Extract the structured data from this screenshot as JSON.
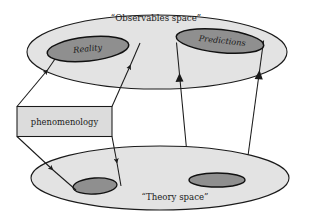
{
  "figure": {
    "background_color": "#ffffff",
    "line_color": "#1a1a1a",
    "plane_fill_color": "#e0e0e0",
    "region_fill_color": "#9a9a9a",
    "box_fill_color": "#dcdcdc"
  },
  "labels": {
    "observables_space": "“Observables space”",
    "theory_space": "“Theory space”",
    "reality": "Reality",
    "predictions": "Predictions",
    "phenomenology": "phenomenology"
  },
  "elements": {
    "observables_plane": {
      "name": "Observables space",
      "shape": "ellipse",
      "cx": 157,
      "cy": 52,
      "rx": 130,
      "ry": 37
    },
    "theory_plane": {
      "name": "Theory space",
      "shape": "ellipse",
      "cx": 160,
      "cy": 178,
      "rx": 129,
      "ry": 32
    },
    "reality_region": {
      "name": "Reality",
      "shape": "ellipse",
      "cx": 88,
      "cy": 49,
      "rx": 41,
      "ry": 12,
      "rotation": -6
    },
    "predictions_region": {
      "name": "Predictions",
      "shape": "ellipse",
      "cx": 220,
      "cy": 41,
      "rx": 44,
      "ry": 12,
      "rotation": 6
    },
    "theory_region": {
      "name": "theory region",
      "shape": "ellipse",
      "cx": 95,
      "cy": 186,
      "rx": 22,
      "ry": 8,
      "rotation": -4
    },
    "predictions_base_region": {
      "name": "predictions base region",
      "shape": "ellipse",
      "cx": 217,
      "cy": 180,
      "rx": 28,
      "ry": 7
    },
    "phenomenology_box": {
      "name": "phenomenology",
      "shape": "rectangle",
      "x": 17,
      "y": 106,
      "width": 95,
      "height": 31
    }
  },
  "connections": [
    {
      "name": "phenomenology-to-reality-left",
      "from": "phenomenology_box",
      "to": "reality_region",
      "direction": "up",
      "arrowhead": true
    },
    {
      "name": "phenomenology-to-reality-right",
      "from": "phenomenology_box",
      "to": "reality_region",
      "direction": "up",
      "arrowhead": true
    },
    {
      "name": "phenomenology-to-theory-left",
      "from": "phenomenology_box",
      "to": "theory_region",
      "direction": "down",
      "arrowhead": true
    },
    {
      "name": "phenomenology-to-theory-right",
      "from": "phenomenology_box",
      "to": "theory_region",
      "direction": "down",
      "arrowhead": true
    },
    {
      "name": "theory-to-predictions-left",
      "from": "predictions_base_region",
      "to": "predictions_region",
      "direction": "up",
      "arrowhead": true
    },
    {
      "name": "theory-to-predictions-right",
      "from": "predictions_base_region",
      "to": "predictions_region",
      "direction": "up",
      "arrowhead": true
    }
  ]
}
